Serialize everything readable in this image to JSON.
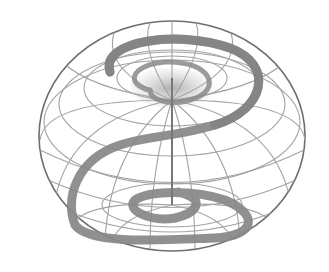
{
  "diagram": {
    "title": "",
    "colors": {
      "background": "#ffffff",
      "grid": "#9a9a9a",
      "outline": "#6e6e6e",
      "band": "#8a8a8a",
      "band_edge": "#6f6f6f",
      "axis": "#7a7a7a",
      "pole_shade": "#b8b8b8"
    },
    "sphere": {
      "cx": 172,
      "cy": 136,
      "rx": 133,
      "ry": 115
    },
    "labels": []
  }
}
